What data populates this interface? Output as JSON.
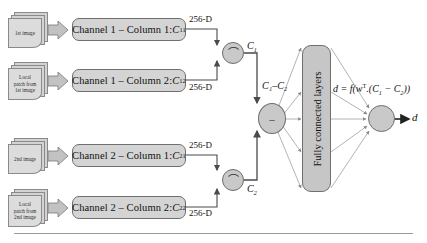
{
  "figure": {
    "type": "neural-network-architecture-diagram",
    "background_color": "#ffffff",
    "box_fill": "#d4d4d4",
    "node_fill": "#c9c9c9",
    "fc_fill": "#c6c6c6",
    "stroke": "#6f6f6f",
    "arrow_color": "#7a7a7a"
  },
  "inputs": [
    {
      "id": "in-1",
      "label": "1st image"
    },
    {
      "id": "in-2",
      "label": "Local\npatch from\n1st image"
    },
    {
      "id": "in-3",
      "label": "2nd image"
    },
    {
      "id": "in-4",
      "label": "Local\npatch from\n2nd image"
    }
  ],
  "input_labels": {
    "first_image": "1st image",
    "local_patch_first": "Local patch from 1st image",
    "local_patch_first_l1": "Local",
    "local_patch_first_l2": "patch from",
    "local_patch_first_l3": "1st image",
    "second_image": "2nd image",
    "local_patch_second_l1": "Local",
    "local_patch_second_l2": "patch from",
    "local_patch_second_l3": "2nd image"
  },
  "channels": [
    {
      "id": "c11",
      "prefix": "Channel 1 – Column 1: ",
      "symbol": "C",
      "subscript": "11"
    },
    {
      "id": "c12",
      "prefix": "Channel 1 – Column 2: ",
      "symbol": "C",
      "subscript": "12"
    },
    {
      "id": "c21",
      "prefix": "Channel 2 – Column 1: ",
      "symbol": "C",
      "subscript": "21"
    },
    {
      "id": "c22",
      "prefix": "Channel 2 – Column 2: ",
      "symbol": "C",
      "subscript": "22"
    }
  ],
  "dimension_labels": {
    "d1": "256-D",
    "d2": "256-D",
    "d3": "256-D",
    "d4": "256-D",
    "value": "256-D"
  },
  "nodes": {
    "merge_top": {
      "glyph": "⌒",
      "operation": "concatenate"
    },
    "merge_bottom": {
      "glyph": "⌒",
      "operation": "concatenate"
    },
    "subtract": {
      "glyph": "–",
      "operation": "subtract"
    },
    "output": {
      "glyph": "",
      "operation": "decision"
    }
  },
  "math_labels": {
    "c1": {
      "symbol": "C",
      "subscript": "1"
    },
    "c2": {
      "symbol": "C",
      "subscript": "2"
    },
    "difference": "C₁–C₂",
    "difference_text": "C",
    "formula_d": "d",
    "formula_eq": " = f(w",
    "formula_sup": "T",
    "formula_rest": ".(C",
    "formula_full": "d = f(wᵀ.(C₁ − C₂))",
    "output_symbol": "d"
  },
  "fully_connected": {
    "label": "Fully connected layers"
  }
}
